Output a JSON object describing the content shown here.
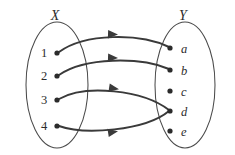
{
  "diagram": {
    "type": "function-mapping-diagram",
    "background_color": "#ffffff",
    "stroke_color": "#3a3a3a",
    "ellipse_stroke_color": "#4a4a4a",
    "dot_color": "#2b2b2b",
    "domain": {
      "label": "X",
      "label_x": 55,
      "label_y": 20,
      "ellipse": {
        "cx": 57,
        "cy": 85,
        "rx": 31,
        "ry": 63
      },
      "elements": [
        {
          "id": "1",
          "label": "1",
          "dot_x": 57,
          "dot_y": 53,
          "label_x": 44,
          "label_y": 57
        },
        {
          "id": "2",
          "label": "2",
          "dot_x": 57,
          "dot_y": 76,
          "label_x": 44,
          "label_y": 80
        },
        {
          "id": "3",
          "label": "3",
          "dot_x": 57,
          "dot_y": 100,
          "label_x": 44,
          "label_y": 104
        },
        {
          "id": "4",
          "label": "4",
          "dot_x": 57,
          "dot_y": 126,
          "label_x": 44,
          "label_y": 130
        }
      ]
    },
    "codomain": {
      "label": "Y",
      "label_x": 183,
      "label_y": 20,
      "ellipse": {
        "cx": 185,
        "cy": 85,
        "rx": 30,
        "ry": 63
      },
      "elements": [
        {
          "id": "a",
          "label": "a",
          "dot_x": 170,
          "dot_y": 48,
          "label_x": 181,
          "label_y": 53
        },
        {
          "id": "b",
          "label": "b",
          "dot_x": 170,
          "dot_y": 70,
          "label_x": 181,
          "label_y": 75
        },
        {
          "id": "c",
          "label": "c",
          "dot_x": 170,
          "dot_y": 91,
          "label_x": 181,
          "label_y": 96
        },
        {
          "id": "d",
          "label": "d",
          "dot_x": 170,
          "dot_y": 111,
          "label_x": 181,
          "label_y": 116
        },
        {
          "id": "e",
          "label": "e",
          "dot_x": 170,
          "dot_y": 131,
          "label_x": 181,
          "label_y": 136
        }
      ]
    },
    "mappings": [
      {
        "from": "1",
        "to": "a",
        "path": "M 59 52 C 85 33 140 33 169 47",
        "head_x": 117,
        "head_y": 34.5,
        "head_angle": 2
      },
      {
        "from": "2",
        "to": "b",
        "path": "M 59 75 C 85 57 140 57 169 69",
        "head_x": 117,
        "head_y": 58,
        "head_angle": 2
      },
      {
        "from": "3",
        "to": "d",
        "path": "M 59 99 C 85 84 143 90 169 110",
        "head_x": 118,
        "head_y": 89,
        "head_angle": 9
      },
      {
        "from": "4",
        "to": "d",
        "path": "M 59 126 C 84 135 145 131 169 111",
        "head_x": 117,
        "head_y": 131.5,
        "head_angle": -9
      }
    ],
    "unmapped_codomain_elements": [
      "c",
      "e"
    ],
    "shared_target": "d"
  }
}
